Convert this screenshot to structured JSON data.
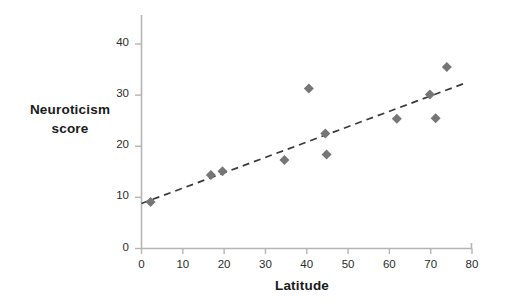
{
  "chart_data": {
    "type": "scatter",
    "title": "",
    "xlabel": "Latitude",
    "ylabel": "Neuroticism score",
    "xlim": [
      0,
      80
    ],
    "ylim": [
      0,
      44
    ],
    "xticks": [
      0,
      10,
      20,
      30,
      40,
      50,
      60,
      70,
      80
    ],
    "yticks": [
      0,
      10,
      20,
      30,
      40
    ],
    "grid": false,
    "legend": null,
    "marker": {
      "shape": "diamond",
      "color": "#767676",
      "size": 9
    },
    "points": [
      {
        "x": 2.2,
        "y": 9.1
      },
      {
        "x": 16.8,
        "y": 14.4
      },
      {
        "x": 19.6,
        "y": 15.1
      },
      {
        "x": 34.6,
        "y": 17.3
      },
      {
        "x": 40.5,
        "y": 31.3
      },
      {
        "x": 44.5,
        "y": 22.5
      },
      {
        "x": 44.8,
        "y": 18.4
      },
      {
        "x": 61.8,
        "y": 25.4
      },
      {
        "x": 69.8,
        "y": 30.1
      },
      {
        "x": 71.2,
        "y": 25.5
      },
      {
        "x": 73.9,
        "y": 35.5
      }
    ],
    "trendline": {
      "style": "dashed",
      "color": "#3a3a3a",
      "x_start": 0,
      "y_start": 8.8,
      "x_end": 78.5,
      "y_end": 32.4
    }
  },
  "axes": {
    "x_tick_labels": [
      "0",
      "10",
      "20",
      "30",
      "40",
      "50",
      "60",
      "70",
      "80"
    ],
    "y_tick_labels": [
      "0",
      "10",
      "20",
      "30",
      "40"
    ],
    "x_title": "Latitude",
    "y_title_line1": "Neuroticism",
    "y_title_line2": "score"
  },
  "colors": {
    "marker": "#767676",
    "trendline": "#3a3a3a",
    "axis": "#b5b5b5",
    "text": "#1a1a1a",
    "background": "#ffffff"
  }
}
